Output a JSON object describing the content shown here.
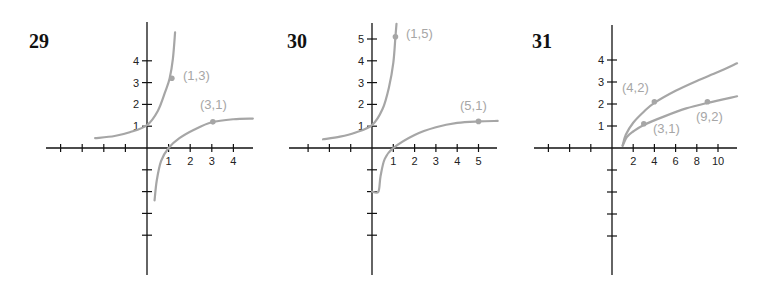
{
  "colors": {
    "axis": "#111111",
    "curve": "#a6a6a6",
    "background": "#ffffff"
  },
  "chart_data": [
    {
      "type": "line",
      "title": "29",
      "origin_px": [
        147,
        148
      ],
      "unit_px": [
        21.6,
        21.8
      ],
      "x_axis_px": [
        46,
        253
      ],
      "y_axis_px": [
        22,
        275
      ],
      "x_ticks": [
        -4,
        -3,
        -2,
        -1,
        1,
        2,
        3,
        4
      ],
      "x_tick_labels": [
        "1",
        "2",
        "3",
        "4"
      ],
      "x_tick_label_values": [
        1,
        2,
        3,
        4
      ],
      "y_ticks": [
        -4,
        -3,
        -2,
        -1,
        1,
        2,
        3,
        4
      ],
      "y_tick_labels": [
        "1",
        "2",
        "3",
        "4"
      ],
      "y_tick_label_values": [
        1,
        2,
        3,
        4
      ],
      "xlim": [
        -4.7,
        4.9
      ],
      "ylim": [
        -5.9,
        5.8
      ],
      "grid": false,
      "series": [
        {
          "name": "exponential branch",
          "points": [
            [
              -2.4,
              0.45
            ],
            [
              -1.5,
              0.55
            ],
            [
              -0.8,
              0.72
            ],
            [
              0,
              1.05
            ],
            [
              0.5,
              1.7
            ],
            [
              0.85,
              2.6
            ],
            [
              1.05,
              3.2
            ],
            [
              1.2,
              4.1
            ],
            [
              1.3,
              5.3
            ]
          ]
        },
        {
          "name": "logarithmic branch",
          "points": [
            [
              0.35,
              -2.4
            ],
            [
              0.45,
              -1.5
            ],
            [
              0.65,
              -0.6
            ],
            [
              1,
              0
            ],
            [
              1.5,
              0.45
            ],
            [
              2.2,
              0.85
            ],
            [
              3,
              1.18
            ],
            [
              4,
              1.32
            ],
            [
              4.9,
              1.35
            ]
          ]
        }
      ],
      "marked_points": [
        {
          "label": "(1,3)",
          "x": 1.15,
          "y": 3.2,
          "label_px": [
            183,
            80
          ]
        },
        {
          "label": "(3,1)",
          "x": 3.05,
          "y": 1.2,
          "label_px": [
            200,
            109
          ]
        }
      ]
    },
    {
      "type": "line",
      "title": "30",
      "origin_px": [
        372,
        148
      ],
      "unit_px": [
        21.3,
        21.8
      ],
      "x_axis_px": [
        289,
        497
      ],
      "y_axis_px": [
        23,
        275
      ],
      "x_ticks": [
        -3,
        -2,
        -1,
        1,
        2,
        3,
        4,
        5
      ],
      "x_tick_labels": [
        "1",
        "2",
        "3",
        "4",
        "5"
      ],
      "x_tick_label_values": [
        1,
        2,
        3,
        4,
        5
      ],
      "y_ticks": [
        -4,
        -3,
        -2,
        -1,
        1,
        2,
        3,
        4,
        5
      ],
      "y_tick_labels": [
        "1",
        "2",
        "3",
        "4",
        "5"
      ],
      "y_tick_label_values": [
        1,
        2,
        3,
        4,
        5
      ],
      "xlim": [
        -3.9,
        5.9
      ],
      "ylim": [
        -5.9,
        5.7
      ],
      "grid": false,
      "series": [
        {
          "name": "exponential branch",
          "points": [
            [
              -2.3,
              0.4
            ],
            [
              -1.5,
              0.52
            ],
            [
              -0.8,
              0.7
            ],
            [
              0,
              1.05
            ],
            [
              0.5,
              1.8
            ],
            [
              0.8,
              2.8
            ],
            [
              1.0,
              3.9
            ],
            [
              1.1,
              5.1
            ],
            [
              1.15,
              5.7
            ]
          ]
        },
        {
          "name": "logarithmic branch",
          "points": [
            [
              0,
              -2
            ],
            [
              0.3,
              -2
            ],
            [
              0.4,
              -1.3
            ],
            [
              0.6,
              -0.5
            ],
            [
              1,
              0
            ],
            [
              2,
              0.6
            ],
            [
              3,
              0.95
            ],
            [
              4,
              1.15
            ],
            [
              5,
              1.22
            ],
            [
              5.9,
              1.24
            ]
          ]
        }
      ],
      "marked_points": [
        {
          "label": "(1,5)",
          "x": 1.1,
          "y": 5.1,
          "label_px": [
            406,
            38
          ]
        },
        {
          "label": "(5,1)",
          "x": 5.0,
          "y": 1.22,
          "label_px": [
            460,
            110
          ]
        }
      ]
    },
    {
      "type": "line",
      "title": "31",
      "origin_px": [
        612,
        148
      ],
      "unit_px": [
        10.6,
        22
      ],
      "x_axis_px": [
        534,
        737
      ],
      "y_axis_px": [
        25,
        275
      ],
      "x_ticks": [
        -6,
        -4,
        -2,
        2,
        4,
        6,
        8,
        10
      ],
      "x_tick_labels": [
        "2",
        "4",
        "6",
        "8",
        "10"
      ],
      "x_tick_label_values": [
        2,
        4,
        6,
        8,
        10
      ],
      "y_ticks": [
        -4,
        -3,
        -2,
        -1,
        1,
        2,
        3,
        4
      ],
      "y_tick_labels": [
        "1",
        "2",
        "3",
        "4"
      ],
      "y_tick_label_values": [
        1,
        2,
        3,
        4
      ],
      "xlim": [
        -7.4,
        11.8
      ],
      "ylim": [
        -5.8,
        5.6
      ],
      "grid": false,
      "series": [
        {
          "name": "upper root curve",
          "points": [
            [
              1,
              0.1
            ],
            [
              1.3,
              0.6
            ],
            [
              2,
              1.15
            ],
            [
              3,
              1.65
            ],
            [
              4,
              2.05
            ],
            [
              6,
              2.6
            ],
            [
              8,
              3.05
            ],
            [
              10,
              3.45
            ],
            [
              11.8,
              3.85
            ]
          ]
        },
        {
          "name": "lower root curve",
          "points": [
            [
              1,
              0.1
            ],
            [
              1.4,
              0.5
            ],
            [
              2,
              0.75
            ],
            [
              3,
              1.05
            ],
            [
              5,
              1.45
            ],
            [
              7,
              1.8
            ],
            [
              9,
              2.05
            ],
            [
              11.8,
              2.35
            ]
          ]
        }
      ],
      "marked_points": [
        {
          "label": "(4,2)",
          "x": 4,
          "y": 2.1,
          "label_px": [
            622,
            92
          ]
        },
        {
          "label": "(3,1)",
          "x": 3,
          "y": 1.1,
          "label_px": [
            653,
            133
          ]
        },
        {
          "label": "(9,2)",
          "x": 9,
          "y": 2.1,
          "label_px": [
            696,
            121
          ]
        }
      ]
    }
  ]
}
